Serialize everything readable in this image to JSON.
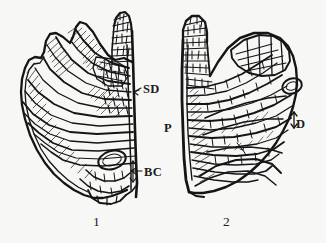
{
  "figure": {
    "type": "scientific-line-drawing",
    "background_color": "#f7f7f6",
    "ink_color": "#151515"
  },
  "labels": [
    {
      "id": "sd",
      "text": "SD",
      "x": 143,
      "y": 83,
      "leader": true
    },
    {
      "id": "bc",
      "text": "BC",
      "x": 144,
      "y": 166,
      "leader": true
    },
    {
      "id": "p",
      "text": "P",
      "x": 164,
      "y": 122,
      "leader": false
    },
    {
      "id": "d",
      "text": "D",
      "x": 296,
      "y": 118,
      "leader": true
    }
  ],
  "figure_numbers": [
    {
      "id": "fig1",
      "text": "1",
      "x": 93,
      "y": 215
    },
    {
      "id": "fig2",
      "text": "2",
      "x": 223,
      "y": 215
    }
  ],
  "specimens": [
    {
      "id": "specimen-1",
      "number": "1",
      "side": "left",
      "labels": [
        "SD",
        "BC"
      ]
    },
    {
      "id": "specimen-2",
      "number": "2",
      "side": "right",
      "labels": [
        "P",
        "D"
      ]
    }
  ]
}
